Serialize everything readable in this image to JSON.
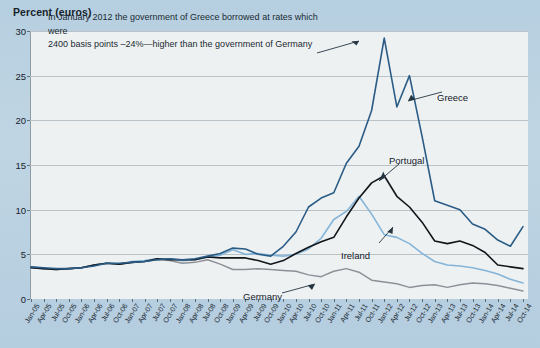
{
  "chart_data": {
    "type": "line",
    "title": "Percent (euros)",
    "ylabel": "Percent (euros)",
    "xlabel": "",
    "ylim": [
      0,
      30
    ],
    "yticks": [
      0,
      5,
      10,
      15,
      20,
      25,
      30
    ],
    "grid": true,
    "legend_position": "inline-annotations",
    "annotation": "In January 2012 the government of Greece borrowed at rates which were 2400 basis points –24%—higher than the government of Germany",
    "annotation_lines": [
      "In January 2012 the government of Greece borrowed at rates which were",
      "2400 basis points –24%—higher than the government of Germany"
    ],
    "categories": [
      "Jan-05",
      "Apr-05",
      "Jul-05",
      "Oct-05",
      "Jan-06",
      "Apr-06",
      "Jul-06",
      "Oct-06",
      "Jan-07",
      "Apr-07",
      "Jul-07",
      "Oct-07",
      "Jan-08",
      "Apr-08",
      "Jul-08",
      "Oct-08",
      "Jan-09",
      "Apr-09",
      "Jul-09",
      "Oct-09",
      "Jan-10",
      "Apr-10",
      "Jul-10",
      "Oct-10",
      "Jan-11",
      "Apr-11",
      "Jul-11",
      "Oct-11",
      "Jan-12",
      "Apr-12",
      "Jul-12",
      "Oct-12",
      "Jan-13",
      "Apr-13",
      "Jul-13",
      "Oct-13",
      "Jan-14",
      "Apr-14",
      "Jul-14",
      "Oct-14"
    ],
    "x_start": "Jan-05",
    "x_end": "Oct-14",
    "series": [
      {
        "name": "Greece",
        "color": "#2a5c86",
        "label_x": 437,
        "label_y": 92,
        "values": [
          3.6,
          3.5,
          3.4,
          3.4,
          3.5,
          3.7,
          4.0,
          4.0,
          4.1,
          4.2,
          4.4,
          4.5,
          4.4,
          4.5,
          4.8,
          5.1,
          5.7,
          5.6,
          5.0,
          4.8,
          5.9,
          7.5,
          10.3,
          11.3,
          11.9,
          15.2,
          17.1,
          21.1,
          29.2,
          21.5,
          25.0,
          18.2,
          11.0,
          10.5,
          10.0,
          8.4,
          7.8,
          6.6,
          5.9,
          8.1
        ]
      },
      {
        "name": "Portugal",
        "color": "#12161a",
        "label_x": 389,
        "label_y": 155,
        "values": [
          3.5,
          3.4,
          3.3,
          3.4,
          3.5,
          3.8,
          4.0,
          3.9,
          4.1,
          4.2,
          4.5,
          4.4,
          4.4,
          4.4,
          4.7,
          4.6,
          4.6,
          4.6,
          4.3,
          3.9,
          4.3,
          5.1,
          5.8,
          6.4,
          6.9,
          9.2,
          11.3,
          13.0,
          13.8,
          11.5,
          10.3,
          8.6,
          6.5,
          6.2,
          6.5,
          6.0,
          5.2,
          3.8,
          3.6,
          3.4
        ]
      },
      {
        "name": "Ireland",
        "color": "#84b4d8",
        "label_x": 341,
        "label_y": 250,
        "values": [
          3.5,
          3.4,
          3.3,
          3.4,
          3.5,
          3.8,
          4.0,
          3.9,
          4.2,
          4.3,
          4.5,
          4.5,
          4.3,
          4.4,
          4.7,
          4.9,
          5.5,
          5.0,
          5.1,
          4.9,
          4.8,
          5.0,
          5.6,
          6.8,
          8.9,
          9.8,
          11.5,
          9.5,
          7.2,
          6.9,
          6.2,
          5.1,
          4.2,
          3.8,
          3.7,
          3.5,
          3.2,
          2.8,
          2.2,
          1.8
        ]
      },
      {
        "name": "Germany",
        "color": "#8d9197",
        "label_x": 243,
        "label_y": 291,
        "values": [
          3.6,
          3.4,
          3.3,
          3.4,
          3.5,
          3.8,
          4.0,
          3.9,
          4.1,
          4.2,
          4.4,
          4.3,
          4.0,
          4.1,
          4.4,
          3.9,
          3.3,
          3.3,
          3.4,
          3.3,
          3.2,
          3.1,
          2.7,
          2.5,
          3.1,
          3.4,
          3.0,
          2.1,
          1.9,
          1.7,
          1.3,
          1.5,
          1.6,
          1.3,
          1.6,
          1.8,
          1.7,
          1.5,
          1.2,
          0.9
        ]
      }
    ]
  }
}
